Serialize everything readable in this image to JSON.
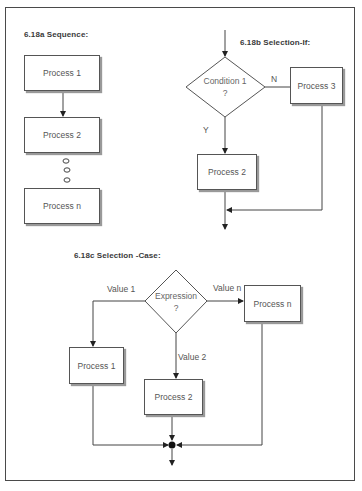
{
  "figure": {
    "sequence": {
      "title": "6.18a   Sequence:",
      "boxes": [
        "Process 1",
        "Process 2",
        "Process n"
      ],
      "ellipsis": "three small circles"
    },
    "selection_if": {
      "title": "6.18b   Selection-If:",
      "decision": {
        "line1": "Condition 1",
        "line2": "?"
      },
      "branch_no_label": "N",
      "branch_yes_label": "Y",
      "boxes": {
        "yes": "Process 2",
        "no": "Process 3"
      }
    },
    "selection_case": {
      "title": "6.18c   Selection -Case:",
      "decision": {
        "line1": "Expression",
        "line2": "?"
      },
      "branch_labels": {
        "left": "Value 1",
        "middle": "Value 2",
        "right": "Value n"
      },
      "boxes": {
        "left": "Process 1",
        "middle": "Process 2",
        "right": "Process n"
      }
    }
  }
}
